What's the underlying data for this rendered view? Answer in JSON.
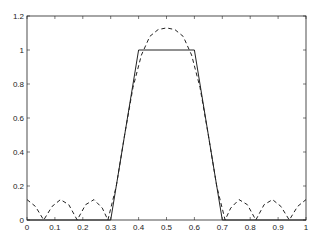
{
  "chart_data": {
    "type": "line",
    "title": "",
    "xlabel": "",
    "ylabel": "",
    "xlim": [
      0,
      1
    ],
    "ylim": [
      0,
      1.2
    ],
    "grid": false,
    "legend": null,
    "x_ticks": [
      "0",
      "0.1",
      "0.2",
      "0.3",
      "0.4",
      "0.5",
      "0.6",
      "0.7",
      "0.8",
      "0.9",
      "1"
    ],
    "y_ticks": [
      "0",
      "0.2",
      "0.4",
      "0.6",
      "0.8",
      "1",
      "1.2"
    ],
    "series": [
      {
        "name": "trapezoid",
        "style": "solid",
        "x": [
          0,
          0.3,
          0.4,
          0.6,
          0.7,
          1.0
        ],
        "y": [
          0,
          0,
          1,
          1,
          0,
          0
        ]
      },
      {
        "name": "approximation",
        "style": "dashed",
        "x": [
          0,
          0.03,
          0.06,
          0.09,
          0.12,
          0.15,
          0.18,
          0.21,
          0.24,
          0.27,
          0.29,
          0.32,
          0.35,
          0.38,
          0.41,
          0.44,
          0.47,
          0.5,
          0.53,
          0.56,
          0.59,
          0.62,
          0.65,
          0.68,
          0.71,
          0.73,
          0.76,
          0.79,
          0.82,
          0.85,
          0.88,
          0.91,
          0.94,
          0.97,
          1.0
        ],
        "y": [
          0.12,
          0.08,
          0.0,
          0.08,
          0.12,
          0.09,
          0.0,
          0.09,
          0.12,
          0.07,
          0.0,
          0.2,
          0.5,
          0.78,
          0.97,
          1.08,
          1.12,
          1.13,
          1.12,
          1.08,
          0.97,
          0.78,
          0.5,
          0.2,
          0.0,
          0.07,
          0.12,
          0.09,
          0.0,
          0.09,
          0.12,
          0.08,
          0.0,
          0.08,
          0.12
        ]
      }
    ]
  }
}
